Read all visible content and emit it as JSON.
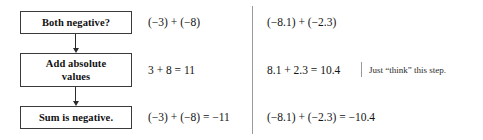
{
  "flowchart": {
    "steps": [
      {
        "label": "Both negative?"
      },
      {
        "label_line1": "Add absolute",
        "label_line2": "values"
      },
      {
        "label": "Sum is negative."
      }
    ],
    "arrows": [
      {
        "name": "arrow-step1-to-step2"
      },
      {
        "name": "arrow-step2-to-step3"
      }
    ]
  },
  "examples": [
    {
      "name": "integer-example",
      "row1": "(−3) + (−8)",
      "row2": "3 + 8 = 11",
      "row3": "(−3) + (−8) = −11"
    },
    {
      "name": "decimal-example",
      "row1": "(−8.1) + (−2.3)",
      "row2": "8.1 + 2.3 = 10.4",
      "row3": "(−8.1) + (−2.3) = −10.4",
      "note": "Just “think” this step."
    }
  ],
  "colors": {
    "box_border": "#3a3a3a",
    "arrow": "#2b2b2b",
    "divider": "#9a9a9a",
    "text": "#141414",
    "background": "#ffffff"
  }
}
